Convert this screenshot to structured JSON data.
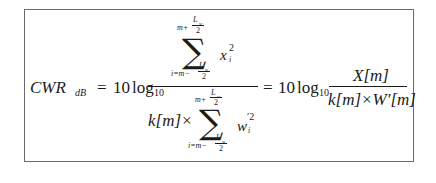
{
  "formula": {
    "lhs": {
      "symbol": "CWR",
      "subscript": "dB"
    },
    "equals": "=",
    "coef": "10",
    "log": "log",
    "log_base": "10",
    "frac1": {
      "numerator": {
        "sum_upper_var": "m+",
        "sum_upper_frac_num": "L",
        "sum_upper_frac_num_sub": "w",
        "sum_upper_frac_den": "2",
        "sigma": "∑",
        "sum_lower_var": "i=m−",
        "sum_lower_frac_num": "L",
        "sum_lower_frac_num_sub": "w",
        "sum_lower_frac_den": "2",
        "term": "x",
        "term_sup": "2",
        "term_sub": "i"
      },
      "denominator": {
        "prefix": "k[m]×",
        "sum_upper_var": "m+",
        "sum_upper_frac_num": "L",
        "sum_upper_frac_num_sub": "w",
        "sum_upper_frac_den": "2",
        "sigma": "∑",
        "sum_lower_var": "i=m−",
        "sum_lower_frac_num": "L",
        "sum_lower_frac_num_sub": "w",
        "sum_lower_frac_den": "2",
        "term": "w",
        "term_sup": "′2",
        "term_sub": "i"
      }
    },
    "equals2": "=",
    "coef2": "10",
    "log2": "log",
    "log2_base": "10",
    "frac2": {
      "numerator": "X[m]",
      "denominator": "k[m]×W′[m]"
    }
  }
}
